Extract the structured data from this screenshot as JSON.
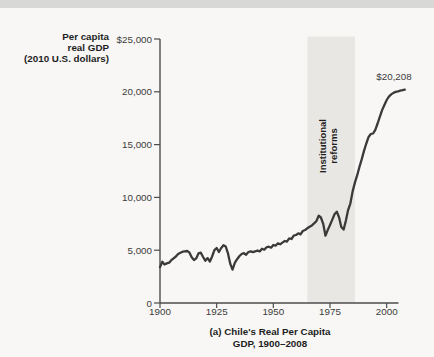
{
  "page": {
    "background_color": "#f8f7f5",
    "top_strip_color": "#d8d8d6"
  },
  "chart_data": {
    "type": "line",
    "title": "(a) Chile's Real Per Capita GDP, 1900–2008",
    "title_lines": [
      "(a) Chile's Real Per Capita",
      "GDP, 1900–2008"
    ],
    "ylabel": "Per capita real GDP (2010 U.S. dollars)",
    "ylabel_lines": [
      "Per capita",
      "real GDP",
      "(2010 U.S. dollars)"
    ],
    "xlabel": "",
    "x_range": [
      1900,
      2008
    ],
    "y_range": [
      0,
      25000
    ],
    "grid": false,
    "legend": false,
    "line_color": "#3a3a3a",
    "axis_color": "#4c4c4c",
    "y_ticks": [
      {
        "label": "$25,000",
        "value": 25000
      },
      {
        "label": "20,000",
        "value": 20000
      },
      {
        "label": "15,000",
        "value": 15000
      },
      {
        "label": "10,000",
        "value": 10000
      },
      {
        "label": "5,000",
        "value": 5000
      },
      {
        "label": "0",
        "value": 0
      }
    ],
    "x_ticks": [
      {
        "label": "1900",
        "value": 1900
      },
      {
        "label": "1925",
        "value": 1925
      },
      {
        "label": "1950",
        "value": 1950
      },
      {
        "label": "1975",
        "value": 1975
      },
      {
        "label": "2000",
        "value": 2000
      }
    ],
    "band": {
      "label": "Institutional reforms",
      "label_lines": [
        "Institutional",
        "reforms"
      ],
      "x_start": 1965,
      "x_end": 1986,
      "color": "#e9e7e3"
    },
    "annotation": {
      "label": "$20,208",
      "x": 2008,
      "y": 20208
    },
    "series": [
      {
        "name": "Chile real per capita GDP (2010 U.S. dollars)",
        "points": [
          [
            1900,
            3400
          ],
          [
            1901,
            3900
          ],
          [
            1902,
            3650
          ],
          [
            1903,
            3750
          ],
          [
            1904,
            3820
          ],
          [
            1905,
            4050
          ],
          [
            1906,
            4230
          ],
          [
            1907,
            4400
          ],
          [
            1908,
            4640
          ],
          [
            1909,
            4750
          ],
          [
            1910,
            4860
          ],
          [
            1911,
            4900
          ],
          [
            1912,
            4920
          ],
          [
            1913,
            4760
          ],
          [
            1914,
            4330
          ],
          [
            1915,
            4070
          ],
          [
            1916,
            4230
          ],
          [
            1917,
            4700
          ],
          [
            1918,
            4760
          ],
          [
            1919,
            4360
          ],
          [
            1920,
            4010
          ],
          [
            1921,
            4250
          ],
          [
            1922,
            3930
          ],
          [
            1923,
            4400
          ],
          [
            1924,
            5000
          ],
          [
            1925,
            5210
          ],
          [
            1926,
            4830
          ],
          [
            1927,
            5210
          ],
          [
            1928,
            5460
          ],
          [
            1929,
            5350
          ],
          [
            1930,
            4700
          ],
          [
            1931,
            3700
          ],
          [
            1932,
            3160
          ],
          [
            1933,
            3800
          ],
          [
            1934,
            4150
          ],
          [
            1935,
            4420
          ],
          [
            1936,
            4640
          ],
          [
            1937,
            4720
          ],
          [
            1938,
            4570
          ],
          [
            1939,
            4830
          ],
          [
            1940,
            4890
          ],
          [
            1941,
            4820
          ],
          [
            1942,
            4900
          ],
          [
            1943,
            4960
          ],
          [
            1944,
            4890
          ],
          [
            1945,
            5140
          ],
          [
            1946,
            5050
          ],
          [
            1947,
            5270
          ],
          [
            1948,
            5330
          ],
          [
            1949,
            5240
          ],
          [
            1950,
            5490
          ],
          [
            1951,
            5430
          ],
          [
            1952,
            5650
          ],
          [
            1953,
            5560
          ],
          [
            1954,
            5720
          ],
          [
            1955,
            5870
          ],
          [
            1956,
            5810
          ],
          [
            1957,
            6130
          ],
          [
            1958,
            6060
          ],
          [
            1959,
            6370
          ],
          [
            1960,
            6440
          ],
          [
            1961,
            6600
          ],
          [
            1962,
            6500
          ],
          [
            1963,
            6820
          ],
          [
            1964,
            6910
          ],
          [
            1965,
            7070
          ],
          [
            1966,
            7230
          ],
          [
            1967,
            7350
          ],
          [
            1968,
            7550
          ],
          [
            1969,
            7760
          ],
          [
            1970,
            8270
          ],
          [
            1971,
            8100
          ],
          [
            1972,
            7500
          ],
          [
            1973,
            6370
          ],
          [
            1974,
            6900
          ],
          [
            1975,
            7390
          ],
          [
            1976,
            7900
          ],
          [
            1977,
            8400
          ],
          [
            1978,
            8650
          ],
          [
            1979,
            8100
          ],
          [
            1980,
            7200
          ],
          [
            1981,
            6950
          ],
          [
            1982,
            7800
          ],
          [
            1983,
            8800
          ],
          [
            1984,
            9440
          ],
          [
            1985,
            10600
          ],
          [
            1986,
            11400
          ],
          [
            1987,
            12100
          ],
          [
            1988,
            12900
          ],
          [
            1989,
            13600
          ],
          [
            1990,
            14400
          ],
          [
            1991,
            15100
          ],
          [
            1992,
            15700
          ],
          [
            1993,
            16000
          ],
          [
            1994,
            16050
          ],
          [
            1995,
            16400
          ],
          [
            1996,
            17000
          ],
          [
            1997,
            17640
          ],
          [
            1998,
            18270
          ],
          [
            1999,
            18750
          ],
          [
            2000,
            19220
          ],
          [
            2001,
            19550
          ],
          [
            2002,
            19750
          ],
          [
            2003,
            19900
          ],
          [
            2004,
            20000
          ],
          [
            2005,
            20050
          ],
          [
            2006,
            20100
          ],
          [
            2007,
            20150
          ],
          [
            2008,
            20208
          ]
        ]
      }
    ]
  }
}
